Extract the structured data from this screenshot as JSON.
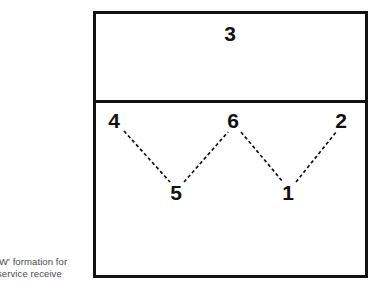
{
  "figure": {
    "caption_line1": "'W' formation for",
    "caption_line2": "service receive",
    "caption_full": "'W' formation for service receive"
  },
  "court": {
    "front_zone_label": "front court",
    "back_zone_label": "back court",
    "attack_line_label": "attack line"
  },
  "players": [
    {
      "id": "p3",
      "number": "3",
      "zone": "front",
      "x": 230,
      "y": 33
    },
    {
      "id": "p4",
      "number": "4",
      "zone": "back",
      "x": 114,
      "y": 120
    },
    {
      "id": "p6",
      "number": "6",
      "zone": "back",
      "x": 233,
      "y": 120
    },
    {
      "id": "p2",
      "number": "2",
      "zone": "back",
      "x": 341,
      "y": 120
    },
    {
      "id": "p5",
      "number": "5",
      "zone": "back",
      "x": 176,
      "y": 192
    },
    {
      "id": "p1",
      "number": "1",
      "zone": "back",
      "x": 288,
      "y": 192
    }
  ],
  "links": [
    {
      "from": "4",
      "to": "5",
      "x1": 124,
      "y1": 131,
      "x2": 170,
      "y2": 182
    },
    {
      "from": "5",
      "to": "6",
      "x1": 184,
      "y1": 182,
      "x2": 228,
      "y2": 132
    },
    {
      "from": "6",
      "to": "1",
      "x1": 241,
      "y1": 132,
      "x2": 283,
      "y2": 182
    },
    {
      "from": "1",
      "to": "2",
      "x1": 296,
      "y1": 182,
      "x2": 337,
      "y2": 131
    }
  ],
  "colors": {
    "line": "#111111",
    "background": "#ffffff",
    "caption_text": "#4a4a4a",
    "number_text": "#111111"
  }
}
